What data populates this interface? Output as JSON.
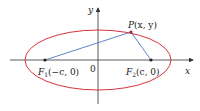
{
  "diagram": {
    "axes": {
      "x_label": "x",
      "y_label": "y",
      "origin_label": "0"
    },
    "point": {
      "label_var": "P",
      "label_coords": "(x, y)"
    },
    "focus1": {
      "label_var": "F",
      "sub": "1",
      "label_coords": "(−c, 0)"
    },
    "focus2": {
      "label_var": "F",
      "sub": "2",
      "label_coords": "(c, 0)"
    },
    "colors": {
      "ellipse": "#d9333f",
      "segments": "#4a78c2",
      "axes": "#333333",
      "points": "#222222"
    }
  }
}
